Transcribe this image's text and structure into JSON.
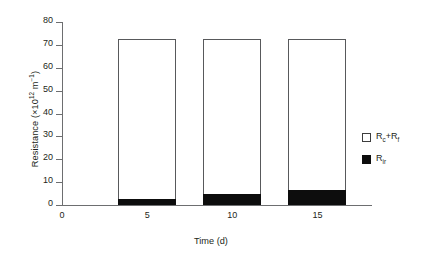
{
  "chart_data": {
    "type": "bar",
    "stacked": true,
    "title": "",
    "xlabel": "Time (d)",
    "ylabel": "Resistance (×10¹² m⁻¹)",
    "ylabel_parts": {
      "text_before": "Resistance (×10",
      "exponent": "12",
      "text_mid": " m",
      "exponent2": "−1",
      "text_after": ")"
    },
    "categories": [
      "5",
      "10",
      "15"
    ],
    "x": [
      5,
      10,
      15
    ],
    "xlim": [
      0,
      17.5
    ],
    "ylim": [
      0,
      80
    ],
    "xticks": [
      "0",
      "5",
      "10",
      "15"
    ],
    "xtick_values": [
      0,
      5,
      10,
      15
    ],
    "yticks": [
      "0",
      "10",
      "20",
      "30",
      "40",
      "50",
      "60",
      "70",
      "80"
    ],
    "ytick_values": [
      0,
      10,
      20,
      30,
      40,
      50,
      60,
      70,
      80
    ],
    "grid": false,
    "legend_position": "right",
    "series": [
      {
        "name": "R_ir",
        "label_base": "R",
        "label_sub": "ir",
        "color": "#0d0d0d",
        "swatch": "filled",
        "values": [
          2.5,
          5.0,
          6.5
        ]
      },
      {
        "name": "R_c+R_f",
        "label_base": "R",
        "label_sub": "c",
        "label_mid": "+R",
        "label_sub2": "f",
        "color": "#ffffff",
        "swatch": "open",
        "values": [
          70.0,
          67.5,
          66.0
        ]
      }
    ],
    "totals": [
      72.5,
      72.5,
      72.5
    ]
  },
  "axes": {
    "y_title": "Resistance",
    "x_title": "Time (d)"
  },
  "legend": {
    "entries": [
      {
        "swatch": "open",
        "base": "R",
        "sub": "c",
        "mid": "+R",
        "sub2": "f"
      },
      {
        "swatch": "filled",
        "base": "R",
        "sub": "ir",
        "mid": "",
        "sub2": ""
      }
    ]
  }
}
